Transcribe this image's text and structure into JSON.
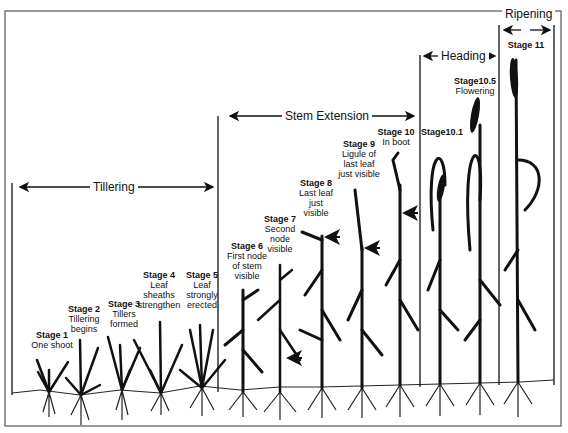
{
  "figure": {
    "phases": [
      {
        "id": "tillering",
        "label": "Tillering"
      },
      {
        "id": "stem-extension",
        "label": "Stem Extension"
      },
      {
        "id": "heading",
        "label": "Heading"
      },
      {
        "id": "ripening",
        "label": "Ripening"
      }
    ],
    "stages": [
      {
        "id": "1",
        "title": "Stage 1",
        "desc": [
          "One shoot"
        ]
      },
      {
        "id": "2",
        "title": "Stage 2",
        "desc": [
          "Tillering",
          "begins"
        ]
      },
      {
        "id": "3",
        "title": "Stage 3",
        "desc": [
          "Tillers",
          "formed"
        ]
      },
      {
        "id": "4",
        "title": "Stage 4",
        "desc": [
          "Leaf",
          "sheaths",
          "strengthen"
        ]
      },
      {
        "id": "5",
        "title": "Stage 5",
        "desc": [
          "Leaf",
          "strongly",
          "erected"
        ]
      },
      {
        "id": "6",
        "title": "Stage 6",
        "desc": [
          "First node",
          "of stem",
          "visible"
        ]
      },
      {
        "id": "7",
        "title": "Stage 7",
        "desc": [
          "Second",
          "node",
          "visible"
        ]
      },
      {
        "id": "8",
        "title": "Stage 8",
        "desc": [
          "Last leaf",
          "just",
          "visible"
        ]
      },
      {
        "id": "9",
        "title": "Stage 9",
        "desc": [
          "Ligule of",
          "last leaf",
          "just visible"
        ]
      },
      {
        "id": "10",
        "title": "Stage 10",
        "desc": [
          "In boot"
        ]
      },
      {
        "id": "10.1",
        "title": "Stage10.1",
        "desc": []
      },
      {
        "id": "10.5",
        "title": "Stage10.5",
        "desc": [
          "Flowering"
        ]
      },
      {
        "id": "11",
        "title": "Stage 11",
        "desc": []
      }
    ]
  }
}
